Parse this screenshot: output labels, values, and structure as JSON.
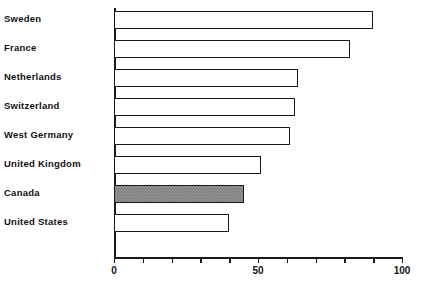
{
  "chart_data": {
    "type": "bar",
    "orientation": "horizontal",
    "title": "",
    "subtitle": "",
    "xlabel": "",
    "ylabel": "",
    "xlim": [
      0,
      100
    ],
    "grid": false,
    "legend": null,
    "categories": [
      "Sweden",
      "France",
      "Netherlands",
      "Switzerland",
      "West Germany",
      "United Kingdom",
      "Canada",
      "United States"
    ],
    "values": [
      90,
      82,
      64,
      63,
      61,
      51,
      45,
      40
    ],
    "bars": [
      {
        "category": "Sweden",
        "value": 90,
        "style": "outline"
      },
      {
        "category": "France",
        "value": 82,
        "style": "outline"
      },
      {
        "category": "Netherlands",
        "value": 64,
        "style": "outline"
      },
      {
        "category": "Switzerland",
        "value": 63,
        "style": "outline"
      },
      {
        "category": "West Germany",
        "value": 61,
        "style": "outline"
      },
      {
        "category": "United Kingdom",
        "value": 51,
        "style": "outline"
      },
      {
        "category": "Canada",
        "value": 45,
        "style": "hatched"
      },
      {
        "category": "United States",
        "value": 40,
        "style": "outline"
      }
    ],
    "highlighted_category": "Canada",
    "x_ticks": [
      0,
      10,
      20,
      30,
      40,
      50,
      60,
      70,
      80,
      90,
      100
    ],
    "x_tick_labels": [
      {
        "value": 0,
        "label": "0"
      },
      {
        "value": 50,
        "label": "50"
      },
      {
        "value": 100,
        "label": "100"
      }
    ],
    "colors": {
      "axis": "#1a1a1a",
      "bar_outline": "#1a1a1a",
      "bar_fill": "#ffffff",
      "highlight_fill": "#9a9a9a",
      "highlight_pattern": "#6e6e6e",
      "text": "#111111",
      "background": "#ffffff"
    }
  }
}
